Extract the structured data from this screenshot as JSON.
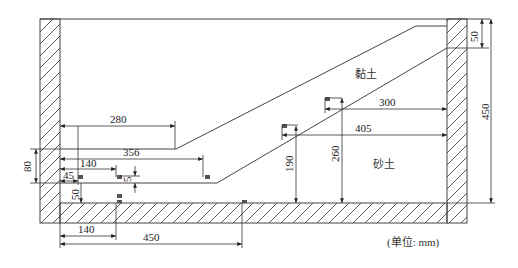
{
  "figure": {
    "regions": {
      "clay_label": "黏土",
      "sand_label": "砂土"
    },
    "units_label": "(单位: mm)",
    "dimensions": {
      "d280": "280",
      "d356": "356",
      "d140_top": "140",
      "d45": "45",
      "d5": "5",
      "d80": "80",
      "d50_left": "50",
      "d140_bottom": "140",
      "d450_bottom": "450",
      "d300": "300",
      "d405": "405",
      "d190": "190",
      "d260": "260",
      "d50_right": "50",
      "d450_right": "450"
    },
    "colors": {
      "line": "#444444",
      "sensor": "#555555"
    }
  }
}
